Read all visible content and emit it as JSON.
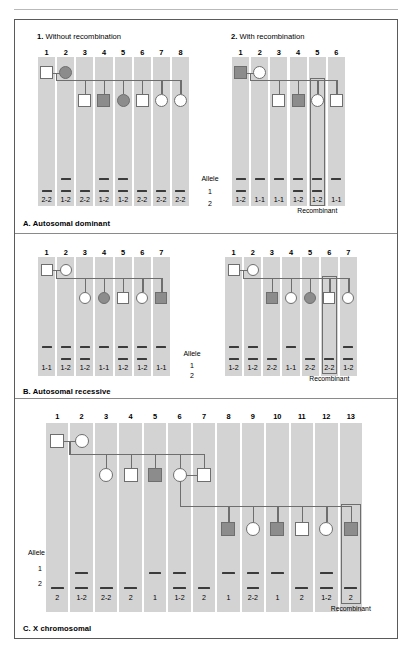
{
  "figure": {
    "top_ghost_text": "",
    "allele_label": "Allele",
    "allele_rows": [
      "1",
      "2"
    ],
    "recombinant_label": "Recombinant"
  },
  "sections": [
    {
      "id": "A",
      "caption": "A. Autosomal dominant",
      "panels": [
        {
          "id": "A1",
          "index_label": "1.",
          "title": "Without recombination",
          "columns": [
            "1",
            "2",
            "3",
            "4",
            "5",
            "6",
            "7",
            "8"
          ],
          "genotypes": [
            "2-2",
            "1-2",
            "2-2",
            "1-2",
            "1-2",
            "2-2",
            "2-2",
            "2-2"
          ],
          "bars": [
            [
              "2"
            ],
            [
              "1",
              "2"
            ],
            [
              "2"
            ],
            [
              "1",
              "2"
            ],
            [
              "1",
              "2"
            ],
            [
              "2"
            ],
            [
              "2"
            ],
            [
              "2"
            ]
          ],
          "symbols": [
            {
              "col": 1,
              "shape": "square",
              "filled": false,
              "gen": 1
            },
            {
              "col": 2,
              "shape": "circle",
              "filled": true,
              "gen": 1
            },
            {
              "col": 3,
              "shape": "square",
              "filled": false,
              "gen": 2
            },
            {
              "col": 4,
              "shape": "square",
              "filled": true,
              "gen": 2
            },
            {
              "col": 5,
              "shape": "circle",
              "filled": true,
              "gen": 2
            },
            {
              "col": 6,
              "shape": "square",
              "filled": false,
              "gen": 2
            },
            {
              "col": 7,
              "shape": "circle",
              "filled": false,
              "gen": 2
            },
            {
              "col": 8,
              "shape": "circle",
              "filled": false,
              "gen": 2
            }
          ],
          "recombinant_column": null
        },
        {
          "id": "A2",
          "index_label": "2.",
          "title": "With recombination",
          "columns": [
            "1",
            "2",
            "3",
            "4",
            "5",
            "6"
          ],
          "genotypes": [
            "1-2",
            "1-1",
            "1-1",
            "1-2",
            "1-2",
            "1-1"
          ],
          "bars": [
            [
              "1",
              "2"
            ],
            [
              "1"
            ],
            [
              "1"
            ],
            [
              "1",
              "2"
            ],
            [
              "1",
              "2"
            ],
            [
              "1"
            ]
          ],
          "symbols": [
            {
              "col": 1,
              "shape": "square",
              "filled": true,
              "gen": 1
            },
            {
              "col": 2,
              "shape": "circle",
              "filled": false,
              "gen": 1
            },
            {
              "col": 3,
              "shape": "square",
              "filled": false,
              "gen": 2
            },
            {
              "col": 4,
              "shape": "square",
              "filled": true,
              "gen": 2
            },
            {
              "col": 5,
              "shape": "circle",
              "filled": false,
              "gen": 2
            },
            {
              "col": 6,
              "shape": "square",
              "filled": false,
              "gen": 2
            }
          ],
          "recombinant_column": 5
        }
      ]
    },
    {
      "id": "B",
      "caption": "B. Autosomal recessive",
      "panels": [
        {
          "id": "B1",
          "index_label": "",
          "title": "",
          "columns": [
            "1",
            "2",
            "3",
            "4",
            "5",
            "6",
            "7"
          ],
          "genotypes": [
            "1-1",
            "1-2",
            "1-2",
            "1-1",
            "1-2",
            "1-2",
            "1-1"
          ],
          "bars": [
            [
              "1"
            ],
            [
              "1",
              "2"
            ],
            [
              "1",
              "2"
            ],
            [
              "1"
            ],
            [
              "1",
              "2"
            ],
            [
              "1",
              "2"
            ],
            [
              "1"
            ]
          ],
          "symbols": [
            {
              "col": 1,
              "shape": "square",
              "filled": false,
              "gen": 1
            },
            {
              "col": 2,
              "shape": "circle",
              "filled": false,
              "gen": 1
            },
            {
              "col": 3,
              "shape": "circle",
              "filled": false,
              "gen": 2
            },
            {
              "col": 4,
              "shape": "circle",
              "filled": true,
              "gen": 2
            },
            {
              "col": 5,
              "shape": "square",
              "filled": false,
              "gen": 2
            },
            {
              "col": 6,
              "shape": "circle",
              "filled": false,
              "gen": 2
            },
            {
              "col": 7,
              "shape": "square",
              "filled": true,
              "gen": 2
            }
          ],
          "recombinant_column": null
        },
        {
          "id": "B2",
          "index_label": "",
          "title": "",
          "columns": [
            "1",
            "2",
            "3",
            "4",
            "5",
            "6",
            "7"
          ],
          "genotypes": [
            "1-2",
            "1-2",
            "2-2",
            "1-1",
            "2-2",
            "2-2",
            "1-2"
          ],
          "bars": [
            [
              "1",
              "2"
            ],
            [
              "1",
              "2"
            ],
            [
              "2"
            ],
            [
              "1"
            ],
            [
              "2"
            ],
            [
              "2"
            ],
            [
              "1",
              "2"
            ]
          ],
          "symbols": [
            {
              "col": 1,
              "shape": "square",
              "filled": false,
              "gen": 1
            },
            {
              "col": 2,
              "shape": "circle",
              "filled": false,
              "gen": 1
            },
            {
              "col": 3,
              "shape": "square",
              "filled": true,
              "gen": 2
            },
            {
              "col": 4,
              "shape": "circle",
              "filled": false,
              "gen": 2
            },
            {
              "col": 5,
              "shape": "circle",
              "filled": true,
              "gen": 2
            },
            {
              "col": 6,
              "shape": "square",
              "filled": false,
              "gen": 2
            },
            {
              "col": 7,
              "shape": "circle",
              "filled": false,
              "gen": 2
            }
          ],
          "recombinant_column": 6
        }
      ]
    },
    {
      "id": "C",
      "caption": "C. X chromosomal",
      "panels": [
        {
          "id": "C1",
          "index_label": "",
          "title": "",
          "columns": [
            "1",
            "2",
            "3",
            "4",
            "5",
            "6",
            "7",
            "8",
            "9",
            "10",
            "11",
            "12",
            "13"
          ],
          "genotypes": [
            "2",
            "1-2",
            "2-2",
            "2",
            "1",
            "1-2",
            "2",
            "1",
            "2-2",
            "1",
            "2",
            "1-2",
            "2"
          ],
          "bars": [
            [
              "2"
            ],
            [
              "1",
              "2"
            ],
            [
              "2"
            ],
            [
              "2"
            ],
            [
              "1"
            ],
            [
              "1",
              "2"
            ],
            [
              "2"
            ],
            [
              "1"
            ],
            [
              "1",
              "2"
            ],
            [
              "1"
            ],
            [
              "2"
            ],
            [
              "1",
              "2"
            ],
            [
              "2"
            ]
          ],
          "symbols": [
            {
              "col": 1,
              "shape": "square",
              "filled": false,
              "gen": 1
            },
            {
              "col": 2,
              "shape": "circle",
              "filled": false,
              "gen": 1
            },
            {
              "col": 3,
              "shape": "circle",
              "filled": false,
              "gen": 2
            },
            {
              "col": 4,
              "shape": "square",
              "filled": false,
              "gen": 2
            },
            {
              "col": 5,
              "shape": "square",
              "filled": true,
              "gen": 2
            },
            {
              "col": 6,
              "shape": "circle",
              "filled": false,
              "gen": 2
            },
            {
              "col": 7,
              "shape": "square",
              "filled": false,
              "gen": 2
            },
            {
              "col": 8,
              "shape": "square",
              "filled": true,
              "gen": 3
            },
            {
              "col": 9,
              "shape": "circle",
              "filled": false,
              "gen": 3
            },
            {
              "col": 10,
              "shape": "square",
              "filled": true,
              "gen": 3
            },
            {
              "col": 11,
              "shape": "square",
              "filled": false,
              "gen": 3
            },
            {
              "col": 12,
              "shape": "circle",
              "filled": false,
              "gen": 3
            },
            {
              "col": 13,
              "shape": "square",
              "filled": true,
              "gen": 3
            }
          ],
          "recombinant_column": 13
        }
      ]
    }
  ],
  "colors": {
    "lane": "#d3d3d3",
    "lane_separator": "#f2f2f2",
    "symbol_fill": "#8c8c8c",
    "symbol_stroke": "#6e6e6e",
    "bar": "#3b3b3b",
    "border": "#5a5a5a"
  }
}
